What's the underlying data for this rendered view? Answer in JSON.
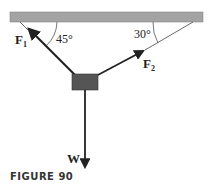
{
  "figure": {
    "caption": "FIGURE 90",
    "forces": {
      "f1": {
        "label": "F",
        "subscript": "1",
        "angle_label": "45°"
      },
      "f2": {
        "label": "F",
        "subscript": "2",
        "angle_label": "30°"
      },
      "w": {
        "label": "W"
      }
    },
    "colors": {
      "ceiling": "#a3a3a3",
      "block": "#555555",
      "arrow": "#222222"
    }
  }
}
